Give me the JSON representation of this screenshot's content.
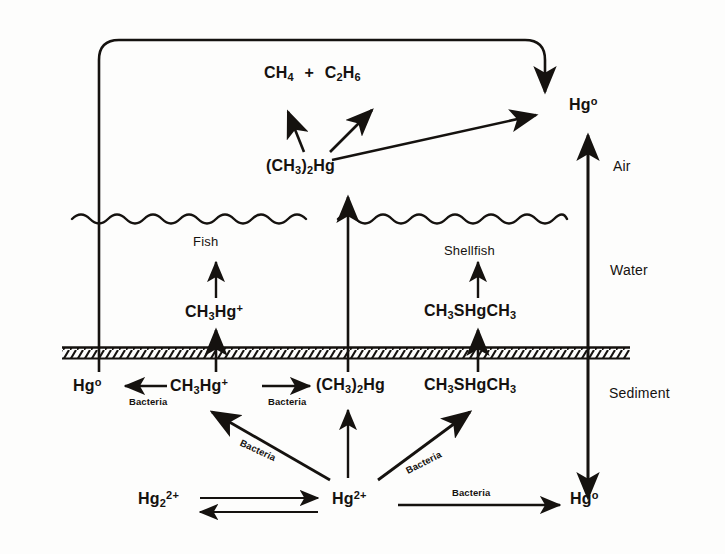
{
  "figure": {
    "ink_color": "#15120f",
    "background": "#fdfdfc"
  },
  "zones": [
    {
      "id": "air",
      "label": "Air"
    },
    {
      "id": "water",
      "label": "Water"
    },
    {
      "id": "sediment",
      "label": "Sediment"
    }
  ],
  "species": {
    "methane": {
      "pre": "CH",
      "sub1": "4",
      "plus": "+",
      "c2": "C",
      "sub2": "2",
      "h": "H",
      "sub3": "6"
    },
    "dimethylmercury_air": {
      "open": "(CH",
      "sub": "3",
      "close": ")",
      "sub_b": "2",
      "tail": "Hg"
    },
    "mercury_vapor_air": {
      "text": "Hg",
      "sup": "o"
    },
    "methylmercury_water": {
      "text": "CH",
      "sub": "3",
      "tail": "Hg",
      "sup": "+"
    },
    "dimethylsulfide_water": {
      "text": "CH",
      "sub": "3",
      "mid": "SHgCH",
      "sub2": "3"
    },
    "mercury_vapor_sediment": {
      "text": "Hg",
      "sup": "o"
    },
    "methylmercury_sediment": {
      "text": "CH",
      "sub": "3",
      "tail": "Hg",
      "sup": "+"
    },
    "dimethylmercury_sediment": {
      "open": "(CH",
      "sub": "3",
      "close": ")",
      "sub_b": "2",
      "tail": "Hg"
    },
    "dimethylsulfide_sediment": {
      "text": "CH",
      "sub": "3",
      "mid": "SHgCH",
      "sub2": "3"
    },
    "mercurous": {
      "text": "Hg",
      "sub": "2",
      "sup": "2+"
    },
    "mercuric": {
      "text": "Hg",
      "sup": "2+"
    },
    "mercury_vapor_bottom": {
      "text": "Hg",
      "sup": "o"
    }
  },
  "organisms": [
    {
      "id": "fish",
      "label": "Fish"
    },
    {
      "id": "shellfish",
      "label": "Shellfish"
    }
  ],
  "process_labels": [
    {
      "id": "bacteria-reduction",
      "label": "Bacteria"
    },
    {
      "id": "bacteria-methylation-1",
      "label": "Bacteria"
    },
    {
      "id": "bacteria-methylation-2",
      "label": "Bacteria"
    },
    {
      "id": "bacteria-methylation-3",
      "label": "Bacteria"
    },
    {
      "id": "bacteria-reduction-2",
      "label": "Bacteria"
    }
  ]
}
